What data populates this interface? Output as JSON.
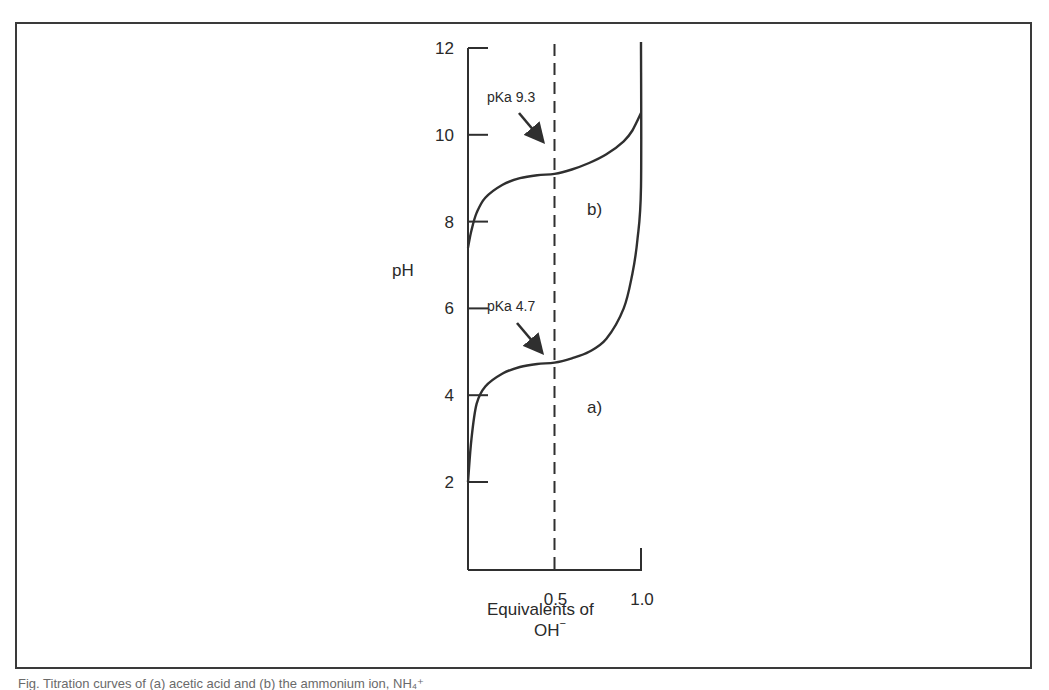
{
  "chart_data": {
    "type": "line",
    "title": "",
    "xlabel": "Equivalents of OH⁻",
    "xlabel_line1": "Equivalents of",
    "xlabel_line2": "OH",
    "xlabel_superscript": "−",
    "ylabel": "pH",
    "xlim": [
      0,
      1.0
    ],
    "ylim": [
      0,
      12
    ],
    "x_ticks": [
      0.5,
      1.0
    ],
    "x_tick_labels": [
      "0.5",
      "1.0"
    ],
    "y_ticks": [
      2,
      4,
      6,
      8,
      10,
      12
    ],
    "y_tick_labels": [
      "2",
      "4",
      "6",
      "8",
      "10",
      "12"
    ],
    "grid": false,
    "legend": "none",
    "reference_line": {
      "x": 0.5,
      "style": "dashed"
    },
    "series": [
      {
        "name": "a)",
        "pKa": 4.7,
        "x": [
          0.0,
          0.02,
          0.05,
          0.1,
          0.2,
          0.3,
          0.4,
          0.5,
          0.6,
          0.7,
          0.8,
          0.9,
          0.95,
          0.98,
          1.0,
          1.0
        ],
        "y": [
          2.0,
          3.0,
          3.8,
          4.2,
          4.5,
          4.65,
          4.72,
          4.75,
          4.85,
          5.0,
          5.3,
          6.0,
          6.8,
          7.6,
          8.8,
          12.2
        ]
      },
      {
        "name": "b)",
        "pKa": 9.3,
        "x": [
          0.0,
          0.02,
          0.05,
          0.1,
          0.2,
          0.3,
          0.4,
          0.5,
          0.6,
          0.7,
          0.8,
          0.9,
          0.95,
          1.0
        ],
        "y": [
          7.4,
          7.8,
          8.2,
          8.55,
          8.85,
          9.0,
          9.07,
          9.1,
          9.2,
          9.35,
          9.55,
          9.85,
          10.1,
          10.5
        ]
      }
    ],
    "annotations": [
      {
        "text": "pKa  9.3",
        "target_series": "b)",
        "target": [
          0.5,
          9.3
        ]
      },
      {
        "text": "pKa  4.7",
        "target_series": "a)",
        "target": [
          0.5,
          4.7
        ]
      }
    ]
  },
  "caption_fragment": "Fig.  Titration curves of (a) acetic acid and (b) the ammonium ion, NH₄⁺"
}
